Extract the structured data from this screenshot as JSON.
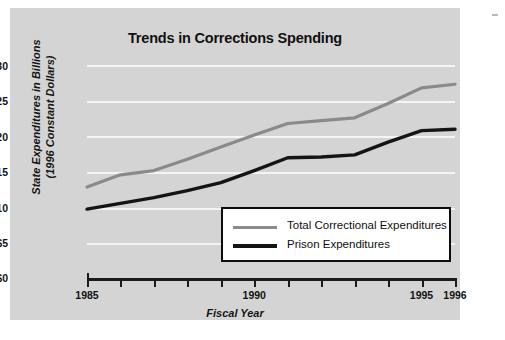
{
  "chart_data": {
    "type": "line",
    "title": "Trends in Corrections Spending",
    "xlabel": "Fiscal Year",
    "ylabel": "State Expenditures in Billions (1996 Constant Dollars)",
    "ylabel_line1": "State Expenditures in Billions",
    "ylabel_line2": "(1996 Constant Dollars)",
    "x": [
      1985,
      1986,
      1987,
      1988,
      1989,
      1990,
      1991,
      1992,
      1993,
      1994,
      1995,
      1996
    ],
    "xlim": [
      1985,
      1996
    ],
    "ylim": [
      0,
      30
    ],
    "ytick_labels": [
      "$0",
      "$5",
      "$10",
      "$15",
      "$20",
      "$25",
      "$30"
    ],
    "ytick_values": [
      0,
      5,
      10,
      15,
      20,
      25,
      30
    ],
    "xtick_labels_shown": [
      "1985",
      "1990",
      "1995",
      "1996"
    ],
    "xtick_values_shown": [
      1985,
      1990,
      1995,
      1996
    ],
    "grid": true,
    "grid_axis": "y",
    "legend_position": "inside-lower-right",
    "series": [
      {
        "name": "Total Correctional Expenditures",
        "color": "#8a8a8a",
        "values": [
          12.9,
          14.6,
          15.2,
          16.8,
          18.5,
          20.2,
          21.8,
          22.2,
          22.6,
          24.6,
          26.8,
          27.3
        ]
      },
      {
        "name": "Prison Expenditures",
        "color": "#141414",
        "values": [
          9.8,
          10.6,
          11.4,
          12.4,
          13.5,
          15.2,
          17.0,
          17.1,
          17.4,
          19.2,
          20.8,
          21.0
        ]
      }
    ]
  },
  "legend": {
    "items": [
      {
        "label": "Total Correctional Expenditures",
        "color": "#8a8a8a"
      },
      {
        "label": "Prison Expenditures",
        "color": "#141414"
      }
    ]
  },
  "bottom_caption": ""
}
